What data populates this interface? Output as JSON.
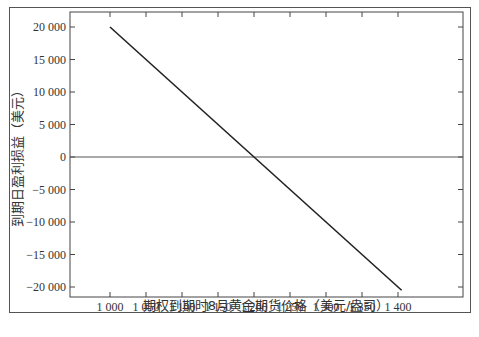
{
  "chart_data": {
    "type": "line",
    "title": "",
    "xlabel": "期权到期时8月黄金期货价格（美元/盎司）",
    "ylabel": "到期日盈利损益（美元）",
    "x_ticks": [
      "1 000",
      "1 050",
      "1 100",
      "1 150",
      "1 200",
      "1 250",
      "1 300",
      "1 350",
      "1 400"
    ],
    "y_ticks": [
      "20 000",
      "15 000",
      "10 000",
      "5 000",
      "0",
      "-5 000",
      "-10 000",
      "-15 000",
      "-20 000"
    ],
    "xlim": [
      950,
      1450
    ],
    "ylim": [
      -21500,
      22500
    ],
    "grid": false,
    "legend": null,
    "series": [
      {
        "name": "profit",
        "x": [
          1000,
          1200,
          1405
        ],
        "y": [
          20000,
          0,
          -20500
        ]
      }
    ],
    "reference_lines": [
      {
        "axis": "y",
        "value": 0
      }
    ]
  }
}
